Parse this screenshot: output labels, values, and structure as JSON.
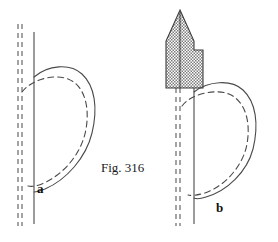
{
  "figure": {
    "caption": "Fig. 316",
    "panels": [
      {
        "id": "a",
        "label": "a"
      },
      {
        "id": "b",
        "label": "b"
      }
    ],
    "colors": {
      "background": "#ffffff",
      "line": "#4a4a4a",
      "dashed_line": "#5a5a5a",
      "hatch_fill": "#b4b4b4",
      "hatch_stroke": "#3c3c3c",
      "text": "#1a1a1a"
    },
    "elements": {
      "solid_curve_name": "teardrop-outline-solid",
      "dashed_curve_name": "teardrop-outline-dashed",
      "vertical_axis_name": "vertical-reference-line",
      "dashed_guides_name": "dashed-guide-lines",
      "hatched_wedge_name": "hatched-wedge-region"
    }
  }
}
